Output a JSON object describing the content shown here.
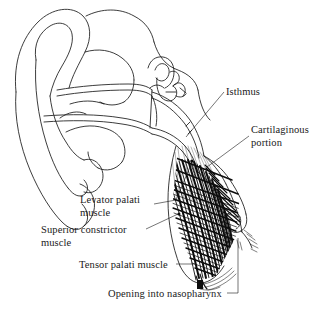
{
  "figure": {
    "width": 327,
    "height": 313,
    "background_color": "#ffffff",
    "ink_color": "#1a1a1a",
    "style": "pen-and-ink line drawing, hatched muscle fibers"
  },
  "labels": {
    "isthmus": "Isthmus",
    "cartilaginous_line1": "Cartilaginous",
    "cartilaginous_line2": "portion",
    "levator_line1": "Levator palati",
    "levator_line2": "muscle",
    "superior_line1": "Superior constrictor",
    "superior_line2": "muscle",
    "tensor": "Tensor palati muscle",
    "opening": "Opening into nasopharynx"
  },
  "structures": [
    {
      "name": "auricle",
      "description": "outer ear pinna, upper left"
    },
    {
      "name": "external-auditory-canal",
      "description": "ear canal leading inward"
    },
    {
      "name": "tympanic-membrane",
      "description": "eardrum"
    },
    {
      "name": "ossicles",
      "description": "malleus, incus and stapes cluster"
    },
    {
      "name": "eustachian-tube",
      "description": "auditory tube running from middle ear down to nasopharynx"
    },
    {
      "name": "isthmus",
      "description": "narrowest part of the eustachian tube"
    },
    {
      "name": "cartilaginous-portion",
      "description": "cartilage hook of the tube near the nasopharynx"
    },
    {
      "name": "levator-palati-muscle",
      "description": "hatched muscle fibers"
    },
    {
      "name": "superior-constrictor-muscle",
      "description": "hatched muscle fibers"
    },
    {
      "name": "tensor-palati-muscle",
      "description": "muscle converging to a tendon at the base"
    },
    {
      "name": "nasopharyngeal-opening",
      "description": "torus tubarius opening into nasopharynx"
    }
  ]
}
